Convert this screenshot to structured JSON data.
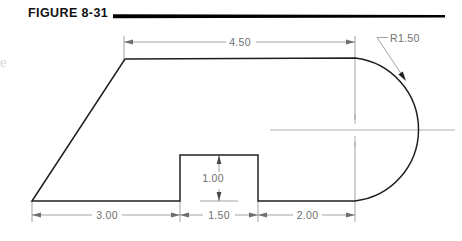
{
  "figure": {
    "title": "FIGURE 8-31",
    "title_rule": {
      "x1": 113,
      "x2": 445,
      "y": 16
    },
    "edge_artifact_glyph": "e"
  },
  "colors": {
    "object_line": "#1f1f21",
    "dimension_line": "#8c8c8c",
    "center_line": "#9a9a9a",
    "dimension_text": "#6f6f6f",
    "title_text": "#111111",
    "background": "#ffffff"
  },
  "drawing": {
    "type": "engineering-part-outline",
    "units": "inches",
    "description": "Flat plate profile: angled left chamfer, flat top, semicircular right end, rectangular notch in bottom edge",
    "outline_points": [
      {
        "name": "bottom-left-vertex",
        "x": 32,
        "y": 201
      },
      {
        "name": "top-left-vertex",
        "x": 125,
        "y": 59
      },
      {
        "name": "top-right-tangent",
        "x": 355,
        "y": 58
      },
      {
        "name": "arc-right-extreme",
        "x": 427,
        "y": 130
      },
      {
        "name": "bottom-right-tangent",
        "x": 355,
        "y": 201
      },
      {
        "name": "notch-right-top",
        "x": 258,
        "y": 155
      },
      {
        "name": "notch-left-top",
        "x": 180,
        "y": 155
      }
    ],
    "arc": {
      "center_x": 355,
      "center_y": 130,
      "radius_px": 72
    },
    "notch": {
      "left_x": 180,
      "right_x": 258,
      "top_y": 155,
      "bottom_y": 201
    }
  },
  "dimensions": [
    {
      "id": "width-top",
      "label": "4.50",
      "orientation": "horizontal",
      "value": 4.5,
      "line_y": 42,
      "x1": 124,
      "x2": 355,
      "text_x": 240,
      "text_y": 45
    },
    {
      "id": "length-left-bottom",
      "label": "3.00",
      "orientation": "horizontal",
      "value": 3.0,
      "line_y": 215,
      "x1": 32,
      "x2": 180,
      "text_x": 106,
      "text_y": 218
    },
    {
      "id": "notch-width",
      "label": "1.50",
      "orientation": "horizontal",
      "value": 1.5,
      "line_y": 215,
      "x1": 180,
      "x2": 258,
      "text_x": 219,
      "text_y": 218
    },
    {
      "id": "length-right-bottom",
      "label": "2.00",
      "orientation": "horizontal",
      "value": 2.0,
      "line_y": 215,
      "x1": 258,
      "x2": 355,
      "text_x": 307,
      "text_y": 218
    },
    {
      "id": "notch-depth",
      "label": "1.00",
      "orientation": "vertical",
      "value": 1.0,
      "line_x": 219,
      "y1": 155,
      "y2": 201,
      "text_x": 213,
      "text_y": 182
    },
    {
      "id": "corner-radius",
      "label": "R1.50",
      "orientation": "leader",
      "value": 1.5,
      "text_x": 390,
      "text_y": 42,
      "leader_elbow_x1": 377,
      "leader_elbow_x2": 388,
      "leader_elbow_y": 38,
      "leader_tip_x": 406,
      "leader_tip_y": 80
    }
  ],
  "center_lines": [
    {
      "id": "horizontal-centerline",
      "x1": 270,
      "x2": 455,
      "y": 130
    },
    {
      "id": "vertical-center-tick",
      "x": 355,
      "y1": 114,
      "y2": 147
    }
  ],
  "extension_lines": [
    {
      "id": "ext-top-left",
      "x": 124,
      "y1": 36,
      "y2": 62
    },
    {
      "id": "ext-top-right",
      "x": 355,
      "y1": 36,
      "y2": 120
    },
    {
      "id": "ext-bottom-left",
      "x": 32,
      "y1": 201,
      "y2": 222
    },
    {
      "id": "ext-notch-left",
      "x": 180,
      "y1": 201,
      "y2": 222
    },
    {
      "id": "ext-notch-right",
      "x": 258,
      "y1": 201,
      "y2": 222
    },
    {
      "id": "ext-bottom-right",
      "x": 355,
      "y1": 142,
      "y2": 222
    }
  ]
}
